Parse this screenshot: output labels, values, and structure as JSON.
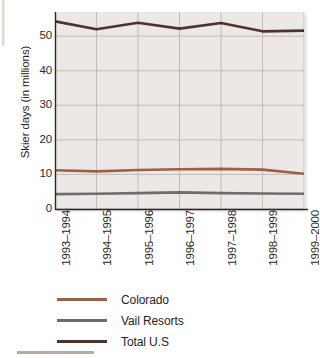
{
  "chart_data": {
    "type": "line",
    "title": "",
    "xlabel": "",
    "ylabel": "Skier days (in millions)",
    "categories": [
      "1993–1994",
      "1994–1995",
      "1995–1996",
      "1996–1997",
      "1997–1998",
      "1998–1999",
      "1999–2000"
    ],
    "ylim": [
      0,
      57
    ],
    "yticks": [
      0,
      10,
      20,
      30,
      40,
      50
    ],
    "ytick_labels": [
      "0",
      "10",
      "20",
      "30",
      "40",
      "50"
    ],
    "grid": true,
    "grid_axes": "both",
    "legend_position": "below",
    "series": [
      {
        "name": "Colorado",
        "color": "#9c5f4a",
        "values": [
          11.2,
          10.9,
          11.3,
          11.5,
          11.6,
          11.4,
          10.2
        ]
      },
      {
        "name": "Vail Resorts",
        "color": "#6f6d6c",
        "values": [
          4.3,
          4.4,
          4.6,
          4.8,
          4.6,
          4.5,
          4.4
        ]
      },
      {
        "name": "Total U.S",
        "color": "#4a342c",
        "values": [
          54.3,
          52.0,
          53.9,
          52.2,
          53.8,
          51.4,
          51.6
        ]
      }
    ]
  },
  "axis": {
    "y_title": "Skier days (in millions)"
  },
  "legend": {
    "items": [
      {
        "label": "Colorado",
        "color": "#9c5f4a"
      },
      {
        "label": "Vail Resorts",
        "color": "#6f6d6c"
      },
      {
        "label": "Total U.S",
        "color": "#4a342c"
      }
    ]
  },
  "colors": {
    "plot_background": "#ece8e5",
    "gridline": "#bdb7b3",
    "axis": "#2b2726",
    "page_background": "#ffffff",
    "footer_rule": "#b9aca6"
  }
}
